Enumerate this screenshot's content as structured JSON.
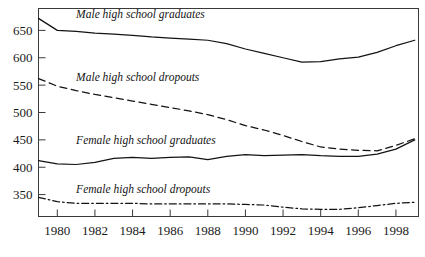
{
  "chart_data": {
    "type": "line",
    "title": "",
    "subtitle": "",
    "xlabel": "",
    "ylabel": "",
    "xlim": [
      1979,
      1999.2
    ],
    "ylim": [
      310,
      690
    ],
    "grid": false,
    "legend_position": "inline-annotations",
    "x_ticks": [
      1980,
      1982,
      1984,
      1986,
      1988,
      1990,
      1992,
      1994,
      1996,
      1998
    ],
    "x_tick_labels": [
      "1980",
      "1982",
      "1984",
      "1986",
      "1988",
      "1990",
      "1992",
      "1994",
      "1996",
      "1998"
    ],
    "y_ticks": [
      350,
      400,
      450,
      500,
      550,
      600,
      650
    ],
    "y_tick_labels": [
      "350",
      "400",
      "450",
      "500",
      "550",
      "600",
      "650"
    ],
    "x": [
      1979,
      1980,
      1981,
      1982,
      1983,
      1984,
      1985,
      1986,
      1987,
      1988,
      1989,
      1990,
      1991,
      1992,
      1993,
      1994,
      1995,
      1996,
      1997,
      1998,
      1999
    ],
    "series": [
      {
        "name": "Male high school graduates",
        "style": "solid",
        "color": "#131313",
        "label": "Male high school graduates",
        "label_x": 1981.0,
        "label_y": 672,
        "values": [
          672,
          650,
          648,
          645,
          643,
          641,
          638,
          636,
          634,
          632,
          626,
          616,
          608,
          600,
          592,
          593,
          598,
          601,
          610,
          622,
          632
        ]
      },
      {
        "name": "Male high school dropouts",
        "style": "dashed",
        "color": "#131313",
        "label": "Male high school dropouts",
        "label_x": 1981.0,
        "label_y": 558,
        "values": [
          562,
          548,
          540,
          533,
          527,
          521,
          515,
          509,
          503,
          496,
          487,
          476,
          468,
          458,
          447,
          437,
          433,
          431,
          430,
          440,
          452
        ]
      },
      {
        "name": "Female high school graduates",
        "style": "solid",
        "color": "#131313",
        "label": "Female high school graduates",
        "label_x": 1981.0,
        "label_y": 443,
        "values": [
          412,
          406,
          405,
          409,
          416,
          418,
          416,
          418,
          419,
          414,
          420,
          423,
          421,
          422,
          423,
          421,
          420,
          420,
          424,
          433,
          450
        ]
      },
      {
        "name": "Female high school dropouts",
        "style": "dashdot",
        "color": "#131313",
        "label": "Female high school dropouts",
        "label_x": 1981.0,
        "label_y": 353,
        "values": [
          345,
          337,
          334,
          334,
          334,
          334,
          333,
          333,
          333,
          333,
          333,
          332,
          331,
          327,
          324,
          323,
          323,
          326,
          330,
          334,
          336
        ]
      }
    ]
  },
  "figure": {
    "background": "#ffffff",
    "frame_color": "#3a3a3a"
  }
}
